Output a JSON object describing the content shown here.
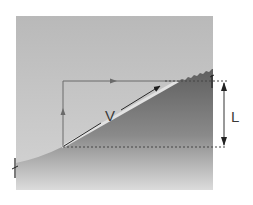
{
  "diagram": {
    "type": "slope-velocity-diagram",
    "labels": {
      "velocity": "V",
      "height": "L"
    },
    "colors": {
      "sky_top": "#bdbdbd",
      "sky_bottom": "#d2d2d2",
      "ground_dark": "#6e6e6e",
      "ground_light": "#d6d6d6",
      "line": "#555555",
      "arrow": "#222222",
      "background": "#ffffff"
    },
    "elements": [
      {
        "name": "horizontal-arrow",
        "description": "horizontal component along top"
      },
      {
        "name": "vertical-arrow",
        "description": "vertical component along left"
      },
      {
        "name": "velocity-arrow",
        "label": "V",
        "description": "diagonal velocity along slope"
      },
      {
        "name": "height-dimension",
        "label": "L",
        "description": "vertical height between dashed lines"
      }
    ]
  }
}
